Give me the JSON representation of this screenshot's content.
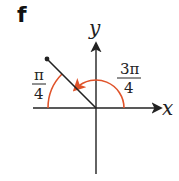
{
  "figure": {
    "label": "f",
    "x_axis_label": "x",
    "y_axis_label": "y",
    "angle_large": {
      "numerator": "3π",
      "denominator": "4"
    },
    "angle_small": {
      "numerator": "π",
      "denominator": "4"
    },
    "colors": {
      "axes": "#222222",
      "terminal_side": "#222222",
      "arc": "#e0532a"
    }
  }
}
